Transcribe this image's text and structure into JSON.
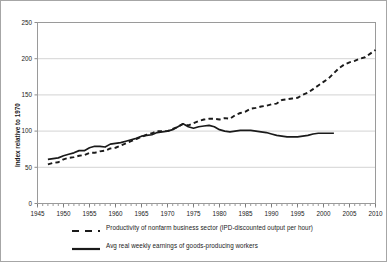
{
  "chart_data": {
    "type": "line",
    "title": "",
    "xlabel": "",
    "ylabel": "Index relative to 1970",
    "xlim": [
      1945,
      2010
    ],
    "ylim": [
      0,
      250
    ],
    "yticks": [
      0,
      50,
      100,
      150,
      200,
      250
    ],
    "xticks": [
      1945,
      1950,
      1955,
      1960,
      1965,
      1970,
      1975,
      1980,
      1985,
      1990,
      1995,
      2000,
      2005,
      2010
    ],
    "xtick_minor_step": 1,
    "grid": "horizontal",
    "legend_position": "bottom",
    "series": [
      {
        "name": "Productivity of nonfarm business sector (IPD-discounted output per hour)",
        "style": "dashed",
        "color": "#1a1a1a",
        "x": [
          1947,
          1948,
          1949,
          1950,
          1951,
          1952,
          1953,
          1954,
          1955,
          1956,
          1957,
          1958,
          1959,
          1960,
          1961,
          1962,
          1963,
          1964,
          1965,
          1966,
          1967,
          1968,
          1969,
          1970,
          1971,
          1972,
          1973,
          1974,
          1975,
          1976,
          1977,
          1978,
          1979,
          1980,
          1981,
          1982,
          1983,
          1984,
          1985,
          1986,
          1987,
          1988,
          1989,
          1990,
          1991,
          1992,
          1993,
          1994,
          1995,
          1996,
          1997,
          1998,
          1999,
          2000,
          2001,
          2002,
          2003,
          2004,
          2005,
          2006,
          2007,
          2008,
          2009,
          2010
        ],
        "y": [
          54,
          56,
          57,
          61,
          63,
          64,
          66,
          67,
          70,
          70,
          72,
          73,
          76,
          77,
          80,
          83,
          86,
          89,
          92,
          95,
          97,
          100,
          100,
          100,
          103,
          106,
          110,
          108,
          111,
          114,
          116,
          117,
          117,
          116,
          118,
          117,
          122,
          125,
          127,
          131,
          132,
          134,
          135,
          137,
          138,
          143,
          144,
          145,
          146,
          150,
          153,
          158,
          163,
          168,
          173,
          180,
          187,
          192,
          195,
          197,
          200,
          202,
          207,
          212
        ]
      },
      {
        "name": "Avg real weekly earnings of goods-producing workers",
        "style": "solid",
        "color": "#1a1a1a",
        "x": [
          1947,
          1948,
          1949,
          1950,
          1951,
          1952,
          1953,
          1954,
          1955,
          1956,
          1957,
          1958,
          1959,
          1960,
          1961,
          1962,
          1963,
          1964,
          1965,
          1966,
          1967,
          1968,
          1969,
          1970,
          1971,
          1972,
          1973,
          1974,
          1975,
          1976,
          1977,
          1978,
          1979,
          1980,
          1981,
          1982,
          1983,
          1984,
          1985,
          1986,
          1987,
          1988,
          1989,
          1990,
          1991,
          1992,
          1993,
          1994,
          1995,
          1996,
          1997,
          1998,
          1999,
          2000,
          2001,
          2002
        ],
        "y": [
          61,
          62,
          63,
          66,
          68,
          70,
          73,
          73,
          77,
          79,
          79,
          78,
          82,
          83,
          84,
          86,
          88,
          90,
          93,
          94,
          95,
          98,
          99,
          100,
          102,
          106,
          110,
          106,
          104,
          106,
          107,
          108,
          106,
          102,
          100,
          99,
          100,
          101,
          101,
          101,
          100,
          99,
          98,
          96,
          94,
          93,
          92,
          92,
          92,
          93,
          94,
          96,
          97,
          97,
          97,
          97
        ]
      }
    ]
  },
  "axis": {
    "y_title": "Index relative to 1970"
  },
  "legend": {
    "items": [
      {
        "label": "Productivity of nonfarm business sector (IPD-discounted output per hour)",
        "style": "dashed"
      },
      {
        "label": "Avg real weekly earnings of goods-producing workers",
        "style": "solid"
      }
    ]
  }
}
